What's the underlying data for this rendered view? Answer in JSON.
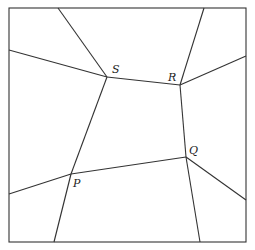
{
  "diagram": {
    "type": "planar-subdivision",
    "frame": {
      "x1": 9,
      "y1": 8,
      "x2": 246,
      "y2": 242
    },
    "stroke_color": "#333333",
    "vertices": [
      {
        "id": "S",
        "label": "S",
        "x": 107,
        "y": 77,
        "label_x": 112,
        "label_y": 64
      },
      {
        "id": "R",
        "label": "R",
        "x": 180,
        "y": 85,
        "label_x": 168,
        "label_y": 72
      },
      {
        "id": "Q",
        "label": "Q",
        "x": 186,
        "y": 157,
        "label_x": 189,
        "label_y": 145
      },
      {
        "id": "P",
        "label": "P",
        "x": 71,
        "y": 174,
        "label_x": 73,
        "label_y": 178
      }
    ],
    "edges": [
      {
        "from": [
          107,
          77
        ],
        "to": [
          58,
          8
        ]
      },
      {
        "from": [
          107,
          77
        ],
        "to": [
          9,
          50
        ]
      },
      {
        "from": [
          107,
          77
        ],
        "to": [
          180,
          85
        ]
      },
      {
        "from": [
          107,
          77
        ],
        "to": [
          71,
          174
        ]
      },
      {
        "from": [
          180,
          85
        ],
        "to": [
          204,
          8
        ]
      },
      {
        "from": [
          180,
          85
        ],
        "to": [
          246,
          56
        ]
      },
      {
        "from": [
          180,
          85
        ],
        "to": [
          186,
          157
        ]
      },
      {
        "from": [
          186,
          157
        ],
        "to": [
          246,
          200
        ]
      },
      {
        "from": [
          186,
          157
        ],
        "to": [
          200,
          242
        ]
      },
      {
        "from": [
          186,
          157
        ],
        "to": [
          71,
          174
        ]
      },
      {
        "from": [
          71,
          174
        ],
        "to": [
          9,
          194
        ]
      },
      {
        "from": [
          71,
          174
        ],
        "to": [
          54,
          242
        ]
      }
    ]
  }
}
